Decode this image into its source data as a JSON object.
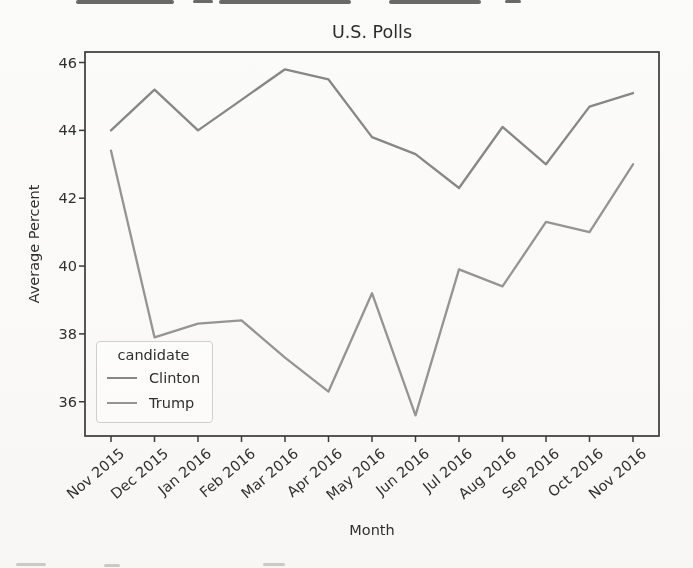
{
  "chart_data": {
    "type": "line",
    "title": "U.S. Polls",
    "xlabel": "Month",
    "ylabel": "Average Percent",
    "categories": [
      "Nov 2015",
      "Dec 2015",
      "Jan 2016",
      "Feb 2016",
      "Mar 2016",
      "Apr 2016",
      "May 2016",
      "Jun 2016",
      "Jul 2016",
      "Aug 2016",
      "Sep 2016",
      "Oct 2016",
      "Nov 2016"
    ],
    "series": [
      {
        "name": "Clinton",
        "color": "#878787",
        "values": [
          44.0,
          45.2,
          44.0,
          44.9,
          45.8,
          45.5,
          43.8,
          43.3,
          42.3,
          44.1,
          43.0,
          44.7,
          45.1
        ]
      },
      {
        "name": "Trump",
        "color": "#949494",
        "values": [
          43.4,
          37.9,
          38.3,
          38.4,
          37.3,
          36.3,
          39.2,
          35.6,
          39.9,
          39.4,
          41.3,
          41.0,
          43.0
        ]
      }
    ],
    "yticks": [
      36,
      38,
      40,
      42,
      44,
      46
    ],
    "ylim": [
      34.99,
      46.31
    ],
    "xtick_rotation": 40,
    "grid": false,
    "axis_color": "#3a3a3a",
    "legend": {
      "title": "candidate",
      "entries": [
        "Clinton",
        "Trump"
      ],
      "position": "lower left"
    }
  }
}
